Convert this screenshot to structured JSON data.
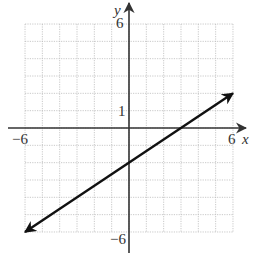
{
  "chart_data": {
    "type": "line",
    "title": "",
    "xlabel": "x",
    "ylabel": "y",
    "xlim": [
      -6,
      6
    ],
    "ylim": [
      -6,
      6
    ],
    "grid": true,
    "grid_step": 1,
    "tick_labels": {
      "x": [
        {
          "value": -6,
          "label": "−6"
        },
        {
          "value": 6,
          "label": "6"
        }
      ],
      "y": [
        {
          "value": 6,
          "label": "6"
        },
        {
          "value": 1,
          "label": "1"
        },
        {
          "value": -6,
          "label": "−6"
        }
      ]
    },
    "series": [
      {
        "name": "line",
        "equation": "y = (2/3)x - 2",
        "slope": 0.6667,
        "y_intercept": -2,
        "x_intercept": 3,
        "points": [
          [
            -6,
            -6
          ],
          [
            0,
            -2
          ],
          [
            3,
            0
          ],
          [
            6,
            2
          ]
        ],
        "arrows": "both",
        "color": "#111111"
      }
    ]
  },
  "labels": {
    "x_axis": "x",
    "y_axis": "y",
    "x_min": "−6",
    "x_max": "6",
    "y_max": "6",
    "y_one": "1",
    "y_min": "−6"
  },
  "colors": {
    "axis": "#333333",
    "grid": "#bbbbbb",
    "line": "#111111",
    "background": "#ffffff"
  }
}
